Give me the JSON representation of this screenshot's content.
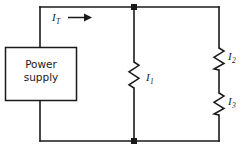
{
  "figure": {
    "name": "parallel-circuit-diagram",
    "background_color": "#ffffff",
    "line_color": "#1a1a1a"
  },
  "source": {
    "label_line_1": "Power",
    "label_line_2": "supply"
  },
  "currents": {
    "total": {
      "symbol": "I",
      "subscript": "T",
      "name": "total-current"
    },
    "branch_1": {
      "symbol": "I",
      "subscript": "1",
      "name": "branch-one-current"
    },
    "branch_2": {
      "symbol": "I",
      "subscript": "2",
      "name": "branch-two-current"
    },
    "branch_3": {
      "symbol": "I",
      "subscript": "3",
      "name": "branch-three-current"
    }
  },
  "components": [
    {
      "name": "resistor-I1",
      "type": "resistor",
      "orientation": "vertical",
      "branch": "middle"
    },
    {
      "name": "resistor-I2",
      "type": "resistor",
      "orientation": "vertical",
      "branch": "right-upper"
    },
    {
      "name": "resistor-I3",
      "type": "resistor",
      "orientation": "vertical",
      "branch": "right-lower"
    }
  ],
  "nodes": [
    {
      "name": "top-junction",
      "x": 134,
      "y": 7
    },
    {
      "name": "bottom-junction",
      "x": 134,
      "y": 141
    }
  ],
  "arrow": {
    "name": "current-direction-arrow",
    "direction": "right"
  }
}
